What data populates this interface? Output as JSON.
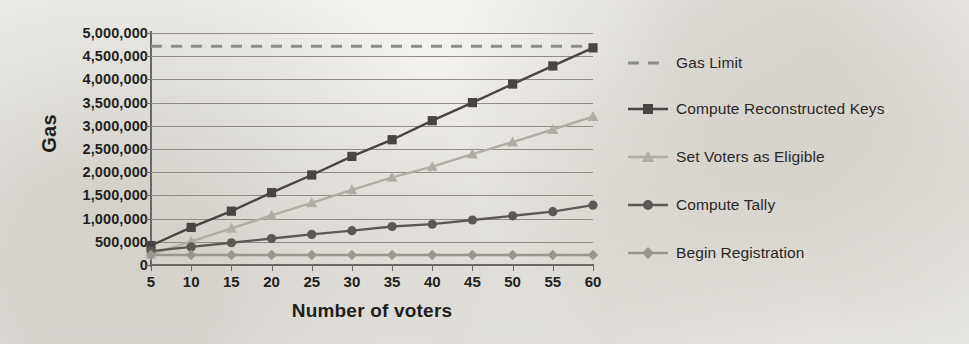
{
  "chart_data": {
    "type": "line",
    "title": "",
    "xlabel": "Number of voters",
    "ylabel": "Gas",
    "x": [
      5,
      10,
      15,
      20,
      25,
      30,
      35,
      40,
      45,
      50,
      55,
      60
    ],
    "xtick_labels": [
      "5",
      "10",
      "15",
      "20",
      "25",
      "30",
      "35",
      "40",
      "45",
      "50",
      "55",
      "60"
    ],
    "ytick_labels": [
      "5,000,000",
      "4,500,000",
      "4,000,000",
      "3,500,000",
      "3,000,000",
      "2,500,000",
      "2,000,000",
      "1,500,000",
      "1,000,000",
      "500,000",
      "0"
    ],
    "ytick_values": [
      5000000,
      4500000,
      4000000,
      3500000,
      3000000,
      2500000,
      2000000,
      1500000,
      1000000,
      500000,
      0
    ],
    "ylim": [
      0,
      5000000
    ],
    "xlim": [
      5,
      60
    ],
    "grid": "horizontal",
    "legend_position": "right",
    "series": [
      {
        "name": "Gas Limit",
        "marker": "none",
        "linestyle": "dashed",
        "color": "#8c8c8c",
        "constant": 4712388,
        "values": [
          4712388,
          4712388,
          4712388,
          4712388,
          4712388,
          4712388,
          4712388,
          4712388,
          4712388,
          4712388,
          4712388,
          4712388
        ]
      },
      {
        "name": "Compute Reconstructed Keys",
        "marker": "square",
        "linestyle": "solid",
        "color": "#4a4543",
        "values": [
          420000,
          810000,
          1160000,
          1560000,
          1940000,
          2340000,
          2700000,
          3110000,
          3500000,
          3900000,
          4290000,
          4680000
        ]
      },
      {
        "name": "Set Voters as Eligible",
        "marker": "triangle",
        "linestyle": "solid",
        "color": "#b0aca6",
        "values": [
          230000,
          510000,
          790000,
          1070000,
          1340000,
          1620000,
          1890000,
          2120000,
          2390000,
          2650000,
          2920000,
          3200000
        ]
      },
      {
        "name": "Compute Tally",
        "marker": "circle",
        "linestyle": "solid",
        "color": "#5e5854",
        "values": [
          300000,
          390000,
          480000,
          570000,
          660000,
          740000,
          830000,
          880000,
          970000,
          1060000,
          1150000,
          1290000
        ]
      },
      {
        "name": "Begin Registration",
        "marker": "diamond",
        "linestyle": "solid",
        "color": "#9b9790",
        "values": [
          215000,
          215000,
          215000,
          215000,
          215000,
          215000,
          215000,
          215000,
          215000,
          215000,
          215000,
          215000
        ]
      }
    ]
  },
  "legend": {
    "items": [
      {
        "label": "Gas Limit"
      },
      {
        "label": "Compute Reconstructed Keys"
      },
      {
        "label": "Set Voters as Eligible"
      },
      {
        "label": "Compute Tally"
      },
      {
        "label": "Begin Registration"
      }
    ]
  }
}
